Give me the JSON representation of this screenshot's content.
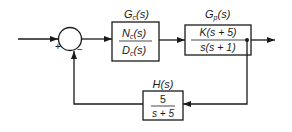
{
  "diagram": {
    "type": "feedback-control-block-diagram",
    "summing_junction": {
      "input_sign": "+",
      "feedback_sign": "−"
    },
    "blocks": {
      "controller": {
        "label": "Gc(s)",
        "label_main": "G",
        "label_sub": "c",
        "label_arg": "(s)",
        "numerator": "Nc(s)",
        "num_main": "N",
        "num_sub": "c",
        "num_arg": "(s)",
        "denominator": "Dc(s)",
        "den_main": "D",
        "den_sub": "c",
        "den_arg": "(s)"
      },
      "plant": {
        "label": "Gp(s)",
        "label_main": "G",
        "label_sub": "p",
        "label_arg": "(s)",
        "numerator": "K(s + 5)",
        "denominator": "s(s + 1)"
      },
      "feedback": {
        "label": "H(s)",
        "numerator": "5",
        "denominator": "s + 5"
      }
    },
    "colors": {
      "line": "#1a1a1a",
      "background": "#ffffff"
    }
  }
}
